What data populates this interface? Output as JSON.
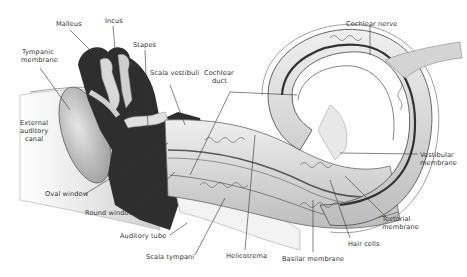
{
  "colors": {
    "background": "#ffffff",
    "bone_dark": "#2e2e2e",
    "tissue_light": "#d9d9d9",
    "tissue_mid": "#b3b3b3",
    "leader_line": "#333333",
    "label_text": "#333333"
  },
  "labels": {
    "malleus": "Malleus",
    "incus": "Incus",
    "stapes": "Stapes",
    "tympanic_membrane_1": "Tympanic",
    "tympanic_membrane_2": "membrane",
    "scala_vestibuli": "Scala vestibuli",
    "cochlear_duct_1": "Cochlear",
    "cochlear_duct_2": "duct",
    "cochlear_nerve": "Cochlear nerve",
    "external_auditory_canal_1": "External",
    "external_auditory_canal_2": "auditory",
    "external_auditory_canal_3": "canal",
    "vestibular_membrane_1": "Vestibular",
    "vestibular_membrane_2": "membrane",
    "oval_window": "Oval window",
    "round_window": "Round window",
    "tectorial_membrane_1": "Tectorial",
    "tectorial_membrane_2": "membrane",
    "auditory_tube": "Auditory tube",
    "hair_cells": "Hair cells",
    "scala_tympani": "Scala tympani",
    "helicotrema": "Helicotrema",
    "basilar_membrane": "Basilar membrane"
  }
}
